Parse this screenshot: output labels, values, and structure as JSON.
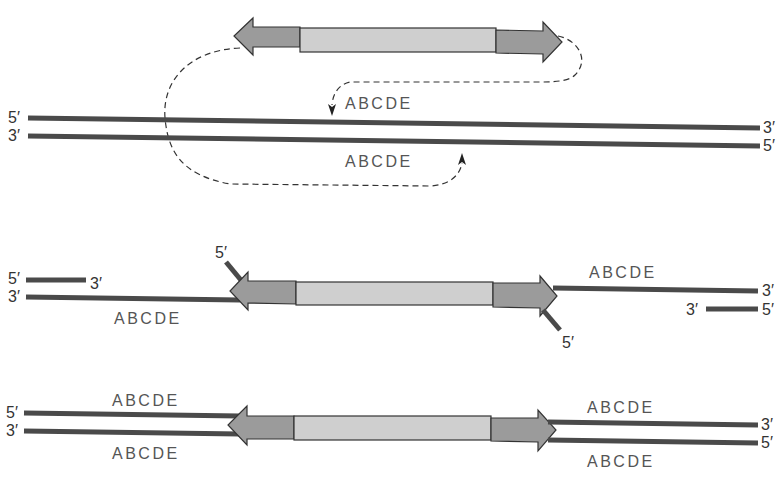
{
  "diagram": {
    "type": "transposon-insertion",
    "colors": {
      "dna_strand": "#4a4a4a",
      "inverted_repeat": "#9b9b9b",
      "transposon_body": "#cfcfcf",
      "text": "#555555"
    },
    "panels": [
      {
        "id": "panel-1",
        "description": "Transposon with target DNA and ABCDE target sequence",
        "top_strand": {
          "left_end": "5′",
          "right_end": "3′",
          "sequence": "ABCDE"
        },
        "bottom_strand": {
          "left_end": "3′",
          "right_end": "5′",
          "sequence": "ABCDE"
        }
      },
      {
        "id": "panel-2",
        "description": "Staggered cut and transposon insertion",
        "left_top_fragment": {
          "left_end": "5′",
          "right_end": "3′"
        },
        "left_bottom_strand": {
          "left_end": "3′",
          "sequence": "ABCDE"
        },
        "transposon_left_tail": {
          "end": "5′"
        },
        "transposon_right_tail": {
          "end": "5′"
        },
        "right_top_strand": {
          "right_end": "3′",
          "sequence": "ABCDE"
        },
        "right_bottom_fragment": {
          "left_end": "3′",
          "right_end": "5′"
        }
      },
      {
        "id": "panel-3",
        "description": "Gaps filled, target sequence duplicated",
        "left_top": {
          "end": "5′",
          "sequence": "ABCDE"
        },
        "left_bottom": {
          "end": "3′",
          "sequence": "ABCDE"
        },
        "right_top": {
          "end": "3′",
          "sequence": "ABCDE"
        },
        "right_bottom": {
          "end": "5′",
          "sequence": "ABCDE"
        }
      }
    ]
  }
}
